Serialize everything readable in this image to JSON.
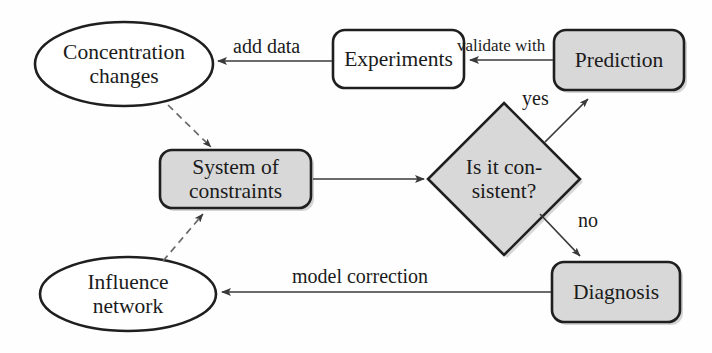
{
  "diagram": {
    "colors": {
      "stroke": "#1f1f1f",
      "fill_shaded": "#d8d8d8",
      "fill_plain": "#ffffff",
      "text": "#1b1b1b",
      "arrow": "#3a3a3a"
    },
    "nodes": [
      {
        "id": "concentration-changes",
        "label": "Concentration\nchanges",
        "shape": "ellipse",
        "fill": "plain"
      },
      {
        "id": "experiments",
        "label": "Experiments",
        "shape": "rounded-rect",
        "fill": "plain"
      },
      {
        "id": "prediction",
        "label": "Prediction",
        "shape": "rounded-rect",
        "fill": "shaded"
      },
      {
        "id": "system-of-constraints",
        "label": "System of\nconstraints",
        "shape": "rounded-rect",
        "fill": "shaded"
      },
      {
        "id": "is-it-consistent",
        "label": "Is it con-\nsistent?",
        "shape": "diamond",
        "fill": "shaded"
      },
      {
        "id": "diagnosis",
        "label": "Diagnosis",
        "shape": "rounded-rect",
        "fill": "shaded"
      },
      {
        "id": "influence-network",
        "label": "Influence\nnetwork",
        "shape": "ellipse",
        "fill": "plain"
      }
    ],
    "edges": [
      {
        "id": "experiments-to-concentration",
        "label": "add data",
        "from": "experiments",
        "to": "concentration-changes",
        "style": "solid"
      },
      {
        "id": "prediction-to-experiments",
        "label": "validate with",
        "from": "prediction",
        "to": "experiments",
        "style": "solid"
      },
      {
        "id": "decision-to-prediction",
        "label": "yes",
        "from": "is-it-consistent",
        "to": "prediction",
        "style": "solid"
      },
      {
        "id": "decision-to-diagnosis",
        "label": "no",
        "from": "is-it-consistent",
        "to": "diagnosis",
        "style": "solid"
      },
      {
        "id": "diagnosis-to-influence",
        "label": "model correction",
        "from": "diagnosis",
        "to": "influence-network",
        "style": "solid"
      },
      {
        "id": "constraints-to-decision",
        "label": "",
        "from": "system-of-constraints",
        "to": "is-it-consistent",
        "style": "solid"
      },
      {
        "id": "concentration-to-constraints",
        "label": "",
        "from": "concentration-changes",
        "to": "system-of-constraints",
        "style": "dashed"
      },
      {
        "id": "influence-to-constraints",
        "label": "",
        "from": "influence-network",
        "to": "system-of-constraints",
        "style": "dashed"
      }
    ]
  }
}
